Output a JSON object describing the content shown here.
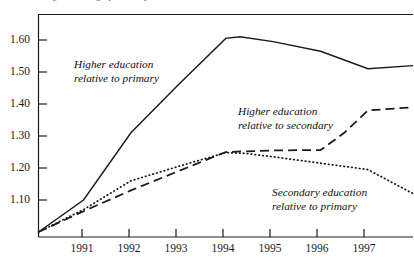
{
  "figure": {
    "clipped_caption": "Figure 3. Wage premia by education level",
    "background_color": "#ffffff",
    "line_color": "#1a1a1a"
  },
  "chart_data": {
    "type": "line",
    "title": "",
    "subtitle": "",
    "xlabel": "",
    "ylabel": "",
    "grid": false,
    "legend_position": "inline-annotations",
    "xlim": [
      1990.05,
      1997.95
    ],
    "ylim": [
      0.995,
      1.655
    ],
    "x_tick_labels": [
      "1991",
      "1992",
      "1993",
      "1994",
      "1995",
      "1996",
      "1997"
    ],
    "x_tick_values": [
      1991,
      1992,
      1993,
      1994,
      1995,
      1996,
      1997
    ],
    "y_tick_labels": [
      "1.10",
      "1.20",
      "1.30",
      "1.40",
      "1.50",
      "1.60"
    ],
    "y_tick_values": [
      1.1,
      1.2,
      1.3,
      1.4,
      1.5,
      1.6
    ],
    "series": [
      {
        "name": "Higher education relative to primary",
        "style": "solid",
        "x": [
          1990.05,
          1991.0,
          1992.0,
          1993.0,
          1994.0,
          1994.3,
          1995.0,
          1996.0,
          1997.0,
          1997.95
        ],
        "values": [
          1.0,
          1.1,
          1.31,
          1.46,
          1.605,
          1.61,
          1.595,
          1.565,
          1.51,
          1.52
        ]
      },
      {
        "name": "Higher education relative to secondary",
        "style": "dashed",
        "x": [
          1990.05,
          1991.0,
          1992.0,
          1993.0,
          1994.0,
          1995.0,
          1996.0,
          1996.5,
          1997.0,
          1997.95
        ],
        "values": [
          1.0,
          1.065,
          1.13,
          1.19,
          1.25,
          1.255,
          1.256,
          1.31,
          1.38,
          1.39
        ]
      },
      {
        "name": "Secondary education relative to primary",
        "style": "dotted",
        "x": [
          1990.05,
          1991.0,
          1992.0,
          1993.0,
          1994.0,
          1994.4,
          1995.0,
          1996.0,
          1997.0,
          1997.95
        ],
        "values": [
          1.0,
          1.07,
          1.16,
          1.205,
          1.248,
          1.246,
          1.235,
          1.215,
          1.195,
          1.12
        ]
      }
    ],
    "annotations": [
      {
        "id": "higher-primary",
        "line1": "Higher education",
        "line2": "relative to primary"
      },
      {
        "id": "higher-secondary",
        "line1": "Higher education",
        "line2": "relative to secondary"
      },
      {
        "id": "secondary-primary",
        "line1": "Secondary education",
        "line2": "relative to primary"
      }
    ]
  }
}
